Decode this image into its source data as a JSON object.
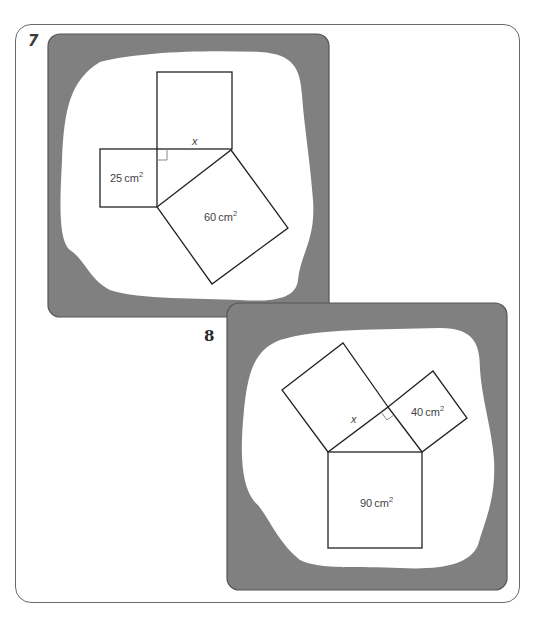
{
  "problems": [
    {
      "number": "7",
      "unknown_label": "x",
      "squares": [
        {
          "id": "top",
          "label": "",
          "role": "side x"
        },
        {
          "id": "small",
          "label": "25",
          "unit": "cm",
          "exp": "2"
        },
        {
          "id": "hyp",
          "label": "60",
          "unit": "cm",
          "exp": "2"
        }
      ]
    },
    {
      "number": "8",
      "unknown_label": "x",
      "squares": [
        {
          "id": "leg-x",
          "label": "",
          "role": "side x"
        },
        {
          "id": "leg-40",
          "label": "40",
          "unit": "cm",
          "exp": "2"
        },
        {
          "id": "hyp",
          "label": "90",
          "unit": "cm",
          "exp": "2"
        }
      ]
    }
  ],
  "colors": {
    "panel": "#808080",
    "blob": "#ffffff",
    "frame": "#6a6a6a"
  }
}
